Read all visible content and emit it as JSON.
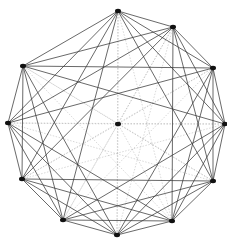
{
  "diagram": {
    "type": "complete-graph",
    "node_count": 12,
    "nodes": [
      {
        "id": "n0",
        "role": "perimeter"
      },
      {
        "id": "n1",
        "role": "perimeter"
      },
      {
        "id": "n2",
        "role": "perimeter"
      },
      {
        "id": "n3",
        "role": "perimeter"
      },
      {
        "id": "n4",
        "role": "perimeter"
      },
      {
        "id": "n5",
        "role": "perimeter"
      },
      {
        "id": "n6",
        "role": "perimeter"
      },
      {
        "id": "n7",
        "role": "perimeter"
      },
      {
        "id": "n8",
        "role": "perimeter"
      },
      {
        "id": "n9",
        "role": "perimeter"
      },
      {
        "id": "n10",
        "role": "perimeter"
      },
      {
        "id": "c",
        "role": "center"
      }
    ],
    "edge_styles": {
      "strong": {
        "color": "#3a3a3a",
        "opacity": 0.85
      },
      "faint": {
        "color": "#9a9a9a",
        "opacity": 0.55,
        "dashed": true
      }
    },
    "node_color": "#111111",
    "background": "#ffffff"
  }
}
